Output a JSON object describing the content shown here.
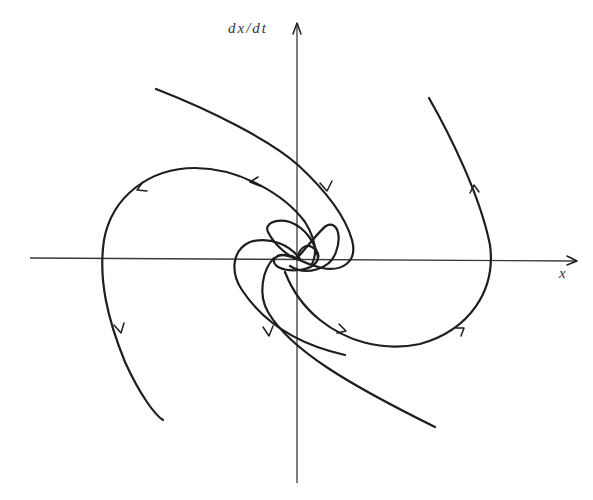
{
  "diagram": {
    "type": "phase-portrait",
    "axes": {
      "x_label": "x",
      "y_label": "dx/dt"
    },
    "colors": {
      "curve": "#1e1e1e",
      "axis": "#3a3a3a",
      "background": "#ffffff"
    },
    "trajectories": [
      {
        "name": "upper-left-loop",
        "arrows": 2,
        "direction": "outward, counterclockwise through upper-left into lower-left"
      },
      {
        "name": "upper-long-arc",
        "arrows": 1,
        "direction": "from upper-left toward the origin region"
      },
      {
        "name": "lower-right-loop",
        "arrows": 2,
        "direction": "outward, through lower-right up into upper-right"
      },
      {
        "name": "right-arc",
        "arrows": 1,
        "direction": "upward in upper-right"
      },
      {
        "name": "lower-long-arc",
        "arrows": 0,
        "direction": "toward lower-right"
      },
      {
        "name": "left-arc",
        "arrows": 1,
        "direction": "downward in lower-left"
      }
    ]
  }
}
